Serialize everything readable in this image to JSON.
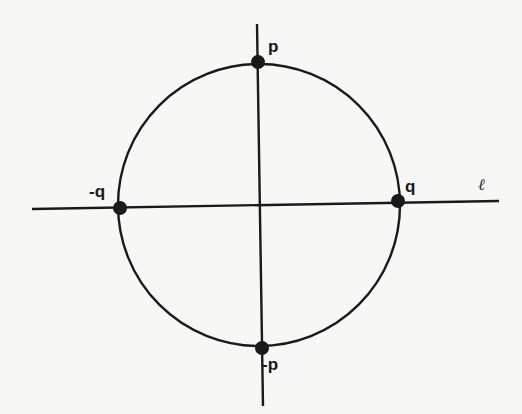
{
  "diagram": {
    "type": "circle-with-axes",
    "colors": {
      "stroke": "#1a1a1a",
      "background": "#f7f7f5"
    },
    "circle": {
      "cx": 259,
      "cy": 205,
      "r": 141
    },
    "lines": [
      {
        "name": "horizontal-line-l",
        "x1": 32,
        "y1": 209,
        "x2": 499,
        "y2": 201
      },
      {
        "name": "vertical-line",
        "x1": 257,
        "y1": 24,
        "x2": 263,
        "y2": 406
      }
    ],
    "points": [
      {
        "name": "point-p",
        "label": "p",
        "x": 258,
        "y": 62,
        "lx": 268,
        "ly": 52
      },
      {
        "name": "point-neg-p",
        "label": "-p",
        "x": 262,
        "y": 348,
        "lx": 264,
        "ly": 370
      },
      {
        "name": "point-neg-q",
        "label": "-q",
        "x": 120,
        "y": 208,
        "lx": 90,
        "ly": 197
      },
      {
        "name": "point-q",
        "label": "q",
        "x": 398,
        "y": 201,
        "lx": 405,
        "ly": 191
      }
    ],
    "line_label": {
      "text": "ℓ",
      "x": 478,
      "y": 190
    }
  }
}
